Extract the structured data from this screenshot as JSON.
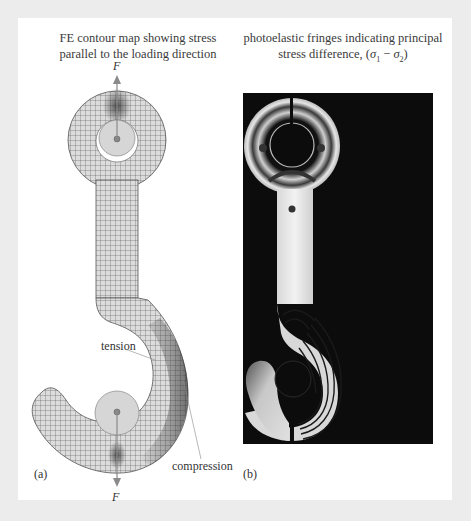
{
  "figure": {
    "panel_a": {
      "caption_line1": "FE contour map showing stress",
      "caption_line2": "parallel to the loading direction",
      "force_top": "F",
      "force_bottom": "F",
      "label_tension": "tension",
      "label_compression": "compression",
      "panel_label": "(a)"
    },
    "panel_b": {
      "caption_line1": "photoelastic fringes indicating principal",
      "caption_line2_prefix": "stress difference, (",
      "sigma1": "σ",
      "sub1": "1",
      "minus": " − ",
      "sigma2": "σ",
      "sub2": "2",
      "caption_line2_suffix": ")",
      "panel_label": "(b)"
    }
  },
  "colors": {
    "mesh_fill": "#d9d9d9",
    "mesh_line": "#555555",
    "high_stress": "#4a4a4a",
    "photo_background": "#0c0c0c",
    "fringe_light": "#e8e8e8",
    "arrow": "#8a8a8a"
  }
}
